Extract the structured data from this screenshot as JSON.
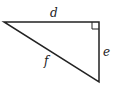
{
  "diagram": {
    "type": "right-triangle",
    "labels": {
      "top_side": "d",
      "right_side": "e",
      "hypotenuse": "f"
    },
    "right_angle_corner": "top-right",
    "stroke_color": "#222222",
    "background": "#ffffff"
  }
}
